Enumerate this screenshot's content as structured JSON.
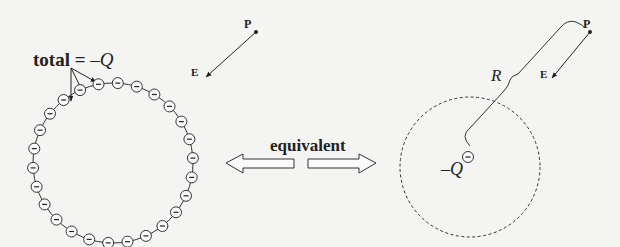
{
  "left_panel": {
    "total_label": "total = ",
    "total_value": "–Q",
    "point_label": "P",
    "field_label": "E",
    "charge_symbol": "–",
    "charge_count": 26,
    "circle": {
      "cx": 113,
      "cy": 163,
      "r": 80
    }
  },
  "center": {
    "equivalent_label": "equivalent"
  },
  "right_panel": {
    "radius_label": "R",
    "charge_label": "–Q",
    "charge_symbol": "–",
    "point_label": "P",
    "field_label": "E",
    "circle": {
      "cx": 470,
      "cy": 167,
      "r": 70,
      "style": "dashed"
    }
  },
  "colors": {
    "background": "#f4f4f2",
    "ink": "#222222"
  }
}
